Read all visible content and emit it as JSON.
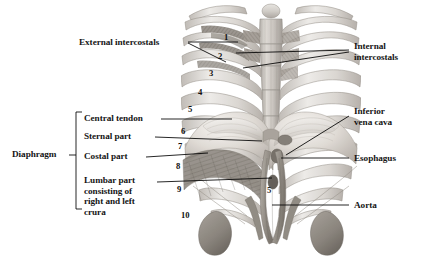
{
  "figure": {
    "background_color": "#ffffff",
    "width": 422,
    "height": 265,
    "line_color": "#000000",
    "text_color": "#151515"
  },
  "labels": {
    "left": [
      {
        "id": "external-intercostals",
        "text": "External intercostals"
      },
      {
        "id": "diaphragm",
        "text": "Diaphragm"
      },
      {
        "id": "central-tendon",
        "text": "Central tendon"
      },
      {
        "id": "sternal-part",
        "text": "Sternal part"
      },
      {
        "id": "costal-part",
        "text": "Costal part"
      },
      {
        "id": "lumbar-part",
        "text": "Lumbar part\nconsisting of\nright and left\ncrura"
      }
    ],
    "right": [
      {
        "id": "internal-intercostals",
        "text": "Internal\nintercostals"
      },
      {
        "id": "inferior-vena-cava",
        "text": "Inferior\nvena cava"
      },
      {
        "id": "esophagus",
        "text": "Esophagus"
      },
      {
        "id": "aorta",
        "text": "Aorta"
      }
    ]
  },
  "rib_numbers": [
    {
      "n": "1"
    },
    {
      "n": "2"
    },
    {
      "n": "3"
    },
    {
      "n": "4"
    },
    {
      "n": "5"
    },
    {
      "n": "6"
    },
    {
      "n": "7"
    },
    {
      "n": "8"
    },
    {
      "n": "9"
    },
    {
      "n": "10"
    },
    {
      "n": "5"
    }
  ],
  "bracket": {
    "name": "diaphragm-bracket",
    "groups": [
      "Central tendon",
      "Sternal part",
      "Costal part",
      "Lumbar part consisting of right and left crura"
    ]
  },
  "colors": {
    "bone_light": "#e9e7e4",
    "bone_mid": "#cdc9c4",
    "bone_shadow": "#a6a19b",
    "muscle_dark": "#7d7872",
    "muscle_mid": "#9b958e",
    "tendon": "#efedea",
    "organ": "#8e8881",
    "outline": "#6e6963"
  }
}
